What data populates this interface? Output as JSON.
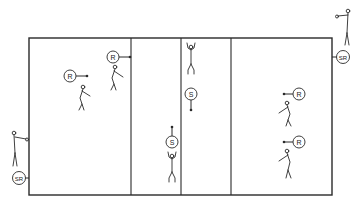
{
  "diagram": {
    "type": "volleyball-court-drill",
    "colors": {
      "line": "#2a2a2a",
      "background": "#ffffff"
    },
    "court": {
      "x": 29,
      "y": 38,
      "width": 303,
      "height": 157,
      "divider_lines_x": [
        131,
        181,
        231
      ]
    },
    "markers": [
      {
        "id": "r1",
        "label": "R",
        "cx": 70,
        "cy": 76,
        "arrow": "right"
      },
      {
        "id": "r2",
        "label": "R",
        "cx": 113,
        "cy": 57,
        "arrow": "right"
      },
      {
        "id": "s1",
        "label": "S",
        "cx": 191,
        "cy": 94,
        "arrow": "down"
      },
      {
        "id": "s2",
        "label": "S",
        "cx": 172,
        "cy": 142,
        "arrow": "up"
      },
      {
        "id": "r3",
        "label": "R",
        "cx": 299,
        "cy": 94,
        "arrow": "left"
      },
      {
        "id": "r4",
        "label": "R",
        "cx": 299,
        "cy": 142,
        "arrow": "left"
      },
      {
        "id": "sr1",
        "label": "SR",
        "cx": 343,
        "cy": 57,
        "arrow": "left"
      },
      {
        "id": "sr2",
        "label": "SR",
        "cx": 19,
        "cy": 178,
        "arrow": "right"
      }
    ],
    "figures": [
      {
        "id": "fig-r1",
        "role": "receiver",
        "x": 82,
        "y": 88
      },
      {
        "id": "fig-r2",
        "role": "receiver",
        "x": 116,
        "y": 68
      },
      {
        "id": "fig-s1",
        "role": "setter",
        "x": 191,
        "y": 57
      },
      {
        "id": "fig-s2",
        "role": "setter",
        "x": 172,
        "y": 154
      },
      {
        "id": "fig-r3",
        "role": "receiver",
        "x": 286,
        "y": 106
      },
      {
        "id": "fig-r4",
        "role": "receiver",
        "x": 286,
        "y": 154
      },
      {
        "id": "fig-sr1",
        "role": "server",
        "x": 348,
        "y": 10
      },
      {
        "id": "fig-sr2",
        "role": "server",
        "x": 14,
        "y": 131
      }
    ]
  }
}
